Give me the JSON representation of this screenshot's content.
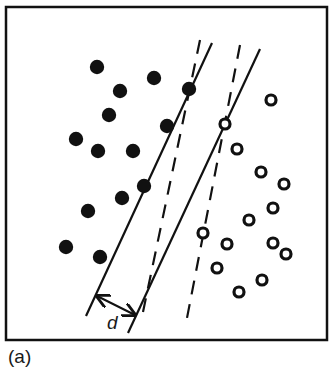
{
  "figure": {
    "caption": "(a)",
    "colors": {
      "ink": "#111111",
      "background": "#ffffff"
    },
    "frame": {
      "x": 6,
      "y": 7,
      "width": 321,
      "height": 333
    },
    "classes": {
      "filled": {
        "name": "class-filled-dots",
        "points": [
          [
            97,
            67
          ],
          [
            154,
            78
          ],
          [
            120,
            91
          ],
          [
            189,
            89
          ],
          [
            109,
            115
          ],
          [
            167,
            126
          ],
          [
            76,
            139
          ],
          [
            98,
            151
          ],
          [
            133,
            151
          ],
          [
            144,
            186
          ],
          [
            122,
            198
          ],
          [
            88,
            211
          ],
          [
            66,
            247
          ],
          [
            100,
            257
          ]
        ]
      },
      "hollow": {
        "name": "class-hollow-circles",
        "points": [
          [
            271,
            100
          ],
          [
            225,
            124
          ],
          [
            237,
            149
          ],
          [
            261,
            172
          ],
          [
            284,
            184
          ],
          [
            273,
            208
          ],
          [
            249,
            220
          ],
          [
            203,
            233
          ],
          [
            227,
            244
          ],
          [
            273,
            243
          ],
          [
            286,
            254
          ],
          [
            217,
            268
          ],
          [
            262,
            280
          ],
          [
            239,
            292
          ]
        ]
      }
    },
    "lines": [
      {
        "name": "separator-1-solid",
        "style": "solid",
        "from": [
          212,
          43
        ],
        "to": [
          86,
          316
        ]
      },
      {
        "name": "separator-1-dashed",
        "style": "dashed",
        "from": [
          200,
          40
        ],
        "to": [
          143,
          312
        ]
      },
      {
        "name": "separator-2-solid",
        "style": "solid",
        "from": [
          260,
          49
        ],
        "to": [
          128,
          333
        ]
      },
      {
        "name": "separator-2-dashed",
        "style": "dashed",
        "from": [
          240,
          45
        ],
        "to": [
          187,
          318
        ]
      }
    ],
    "margin_arrow": {
      "label": "d",
      "from": [
        97,
        296
      ],
      "to": [
        135,
        315
      ],
      "label_pos": [
        107,
        329
      ]
    }
  }
}
